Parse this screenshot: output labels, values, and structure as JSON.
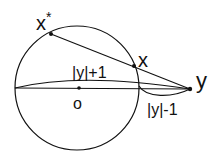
{
  "diagram": {
    "colors": {
      "stroke": "#111111",
      "background": "#ffffff"
    },
    "circle": {
      "cx": 77,
      "cy": 88,
      "r": 62
    },
    "points": {
      "x_star": {
        "label": "x",
        "superscript": "*",
        "cx": 51,
        "cy": 34
      },
      "x": {
        "label": "x",
        "cx": 134,
        "cy": 66
      },
      "y": {
        "label": "y",
        "cx": 190,
        "cy": 89
      },
      "o": {
        "label": "o",
        "cx": 79,
        "cy": 88
      }
    },
    "labels": {
      "upper_arc": "|y|+1",
      "lower_arc": "|y|-1"
    }
  }
}
